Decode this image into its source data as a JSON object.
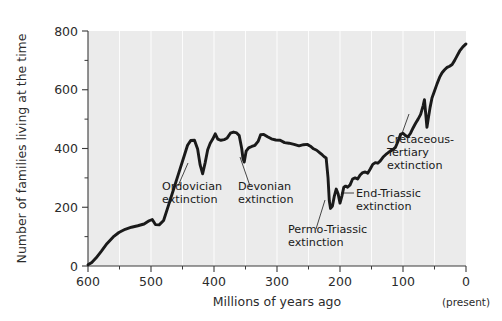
{
  "chart_data": {
    "type": "line",
    "title": "",
    "xlabel": "Millions of years ago",
    "ylabel": "Number of families living at the time",
    "xlim": [
      600,
      0
    ],
    "ylim": [
      0,
      800
    ],
    "x_ticks": [
      600,
      500,
      400,
      300,
      200,
      100,
      0
    ],
    "x_minor_ticks": [
      550,
      450,
      350,
      250,
      150,
      50
    ],
    "y_ticks": [
      0,
      200,
      400,
      600,
      800
    ],
    "y_minor_ticks": [
      100,
      300,
      500,
      700
    ],
    "x_axis_note": "(present)",
    "grid": "vertical-white",
    "legend": "none",
    "series_name": "Number of families",
    "points": [
      [
        600,
        5
      ],
      [
        592,
        8
      ],
      [
        585,
        20
      ],
      [
        578,
        40
      ],
      [
        570,
        62
      ],
      [
        560,
        88
      ],
      [
        552,
        105
      ],
      [
        545,
        118
      ],
      [
        536,
        128
      ],
      [
        528,
        132
      ],
      [
        520,
        136
      ],
      [
        512,
        140
      ],
      [
        505,
        150
      ],
      [
        500,
        155
      ],
      [
        494,
        140
      ],
      [
        488,
        138
      ],
      [
        480,
        150
      ],
      [
        472,
        200
      ],
      [
        464,
        255
      ],
      [
        456,
        310
      ],
      [
        448,
        365
      ],
      [
        442,
        408
      ],
      [
        438,
        425
      ],
      [
        434,
        428
      ],
      [
        430,
        428
      ],
      [
        426,
        400
      ],
      [
        422,
        350
      ],
      [
        418,
        318
      ],
      [
        414,
        348
      ],
      [
        410,
        392
      ],
      [
        406,
        415
      ],
      [
        402,
        430
      ],
      [
        398,
        448
      ],
      [
        394,
        432
      ],
      [
        390,
        428
      ],
      [
        386,
        428
      ],
      [
        382,
        432
      ],
      [
        378,
        442
      ],
      [
        374,
        452
      ],
      [
        370,
        455
      ],
      [
        366,
        455
      ],
      [
        362,
        448
      ],
      [
        358,
        410
      ],
      [
        356,
        372
      ],
      [
        353,
        355
      ],
      [
        350,
        388
      ],
      [
        346,
        400
      ],
      [
        342,
        405
      ],
      [
        338,
        408
      ],
      [
        332,
        420
      ],
      [
        328,
        445
      ],
      [
        322,
        448
      ],
      [
        316,
        440
      ],
      [
        310,
        432
      ],
      [
        304,
        428
      ],
      [
        298,
        428
      ],
      [
        292,
        420
      ],
      [
        286,
        418
      ],
      [
        280,
        418
      ],
      [
        272,
        412
      ],
      [
        264,
        408
      ],
      [
        258,
        412
      ],
      [
        252,
        415
      ],
      [
        248,
        410
      ],
      [
        252,
        408
      ],
      [
        248,
        402
      ],
      [
        244,
        398
      ],
      [
        240,
        396
      ],
      [
        236,
        390
      ],
      [
        232,
        386
      ],
      [
        228,
        382
      ],
      [
        226,
        378
      ],
      [
        252,
        408
      ],
      [
        248,
        402
      ]
    ],
    "polyline": [
      [
        600,
        4
      ],
      [
        593,
        10
      ],
      [
        586,
        24
      ],
      [
        578,
        46
      ],
      [
        569,
        72
      ],
      [
        559,
        96
      ],
      [
        550,
        112
      ],
      [
        541,
        124
      ],
      [
        532,
        131
      ],
      [
        522,
        136
      ],
      [
        512,
        141
      ],
      [
        504,
        152
      ],
      [
        499,
        157
      ],
      [
        494,
        141
      ],
      [
        488,
        139
      ],
      [
        481,
        151
      ],
      [
        473,
        203
      ],
      [
        465,
        258
      ],
      [
        457,
        312
      ],
      [
        449,
        366
      ],
      [
        443,
        409
      ],
      [
        438,
        426
      ],
      [
        432,
        428
      ],
      [
        427,
        400
      ],
      [
        423,
        347
      ],
      [
        419,
        316
      ],
      [
        415,
        350
      ],
      [
        411,
        394
      ],
      [
        407,
        417
      ],
      [
        403,
        431
      ],
      [
        399,
        449
      ],
      [
        395,
        433
      ],
      [
        390,
        428
      ],
      [
        385,
        429
      ],
      [
        380,
        434
      ],
      [
        375,
        450
      ],
      [
        370,
        456
      ],
      [
        365,
        454
      ],
      [
        361,
        446
      ],
      [
        357,
        404
      ],
      [
        355,
        368
      ],
      [
        353,
        354
      ],
      [
        350,
        390
      ],
      [
        346,
        401
      ],
      [
        341,
        406
      ],
      [
        336,
        410
      ],
      [
        331,
        422
      ],
      [
        327,
        446
      ],
      [
        322,
        448
      ],
      [
        316,
        440
      ],
      [
        310,
        433
      ],
      [
        303,
        429
      ],
      [
        296,
        428
      ],
      [
        289,
        420
      ],
      [
        282,
        418
      ],
      [
        274,
        414
      ],
      [
        266,
        409
      ],
      [
        259,
        413
      ],
      [
        253,
        414
      ],
      [
        248,
        409
      ],
      [
        243,
        400
      ],
      [
        238,
        395
      ],
      [
        233,
        386
      ],
      [
        229,
        380
      ],
      [
        226,
        374
      ],
      [
        252,
        412
      ],
      [
        246,
        402
      ],
      [
        251,
        410
      ]
    ],
    "curve": [
      [
        600,
        4
      ],
      [
        594,
        12
      ],
      [
        587,
        28
      ],
      [
        579,
        50
      ],
      [
        570,
        76
      ],
      [
        560,
        99
      ],
      [
        551,
        114
      ],
      [
        541,
        125
      ],
      [
        531,
        132
      ],
      [
        521,
        137
      ],
      [
        511,
        143
      ],
      [
        503,
        154
      ],
      [
        498,
        158
      ],
      [
        493,
        141
      ],
      [
        487,
        140
      ],
      [
        480,
        155
      ],
      [
        472,
        208
      ],
      [
        464,
        262
      ],
      [
        456,
        316
      ],
      [
        448,
        370
      ],
      [
        442,
        411
      ],
      [
        437,
        427
      ],
      [
        431,
        428
      ],
      [
        426,
        398
      ],
      [
        422,
        344
      ],
      [
        418,
        314
      ],
      [
        414,
        352
      ],
      [
        410,
        396
      ],
      [
        406,
        418
      ],
      [
        402,
        432
      ],
      [
        398,
        450
      ],
      [
        394,
        432
      ],
      [
        389,
        428
      ],
      [
        384,
        430
      ],
      [
        379,
        436
      ],
      [
        374,
        452
      ],
      [
        369,
        456
      ],
      [
        364,
        453
      ],
      [
        360,
        444
      ],
      [
        356,
        400
      ],
      [
        354,
        366
      ],
      [
        352,
        354
      ],
      [
        349,
        391
      ],
      [
        345,
        402
      ],
      [
        340,
        407
      ],
      [
        335,
        411
      ],
      [
        330,
        424
      ],
      [
        326,
        447
      ],
      [
        321,
        448
      ],
      [
        315,
        440
      ],
      [
        309,
        433
      ],
      [
        302,
        429
      ],
      [
        295,
        428
      ],
      [
        288,
        420
      ],
      [
        281,
        418
      ],
      [
        273,
        414
      ],
      [
        265,
        409
      ],
      [
        258,
        413
      ],
      [
        252,
        414
      ],
      [
        247,
        408
      ],
      [
        242,
        399
      ],
      [
        237,
        394
      ],
      [
        232,
        385
      ],
      [
        228,
        378
      ],
      [
        225,
        372
      ],
      [
        222,
        368
      ],
      [
        219,
        300
      ],
      [
        217,
        222
      ],
      [
        215,
        196
      ],
      [
        212,
        204
      ],
      [
        209,
        238
      ],
      [
        206,
        262
      ],
      [
        203,
        246
      ],
      [
        200,
        214
      ],
      [
        197,
        238
      ],
      [
        194,
        268
      ],
      [
        191,
        272
      ],
      [
        188,
        268
      ],
      [
        184,
        276
      ],
      [
        180,
        296
      ],
      [
        176,
        300
      ],
      [
        172,
        296
      ],
      [
        168,
        310
      ],
      [
        164,
        318
      ],
      [
        160,
        320
      ],
      [
        156,
        316
      ],
      [
        152,
        330
      ],
      [
        148,
        346
      ],
      [
        144,
        352
      ],
      [
        140,
        350
      ],
      [
        136,
        358
      ],
      [
        131,
        372
      ],
      [
        126,
        382
      ],
      [
        121,
        390
      ],
      [
        116,
        396
      ],
      [
        112,
        404
      ],
      [
        108,
        424
      ],
      [
        104,
        448
      ],
      [
        100,
        452
      ],
      [
        96,
        444
      ],
      [
        92,
        440
      ],
      [
        88,
        452
      ],
      [
        84,
        470
      ],
      [
        80,
        486
      ],
      [
        76,
        500
      ],
      [
        72,
        516
      ],
      [
        68,
        546
      ],
      [
        66,
        566
      ],
      [
        64,
        520
      ],
      [
        62,
        472
      ],
      [
        60,
        500
      ],
      [
        57,
        540
      ],
      [
        54,
        572
      ],
      [
        50,
        596
      ],
      [
        46,
        620
      ],
      [
        42,
        642
      ],
      [
        38,
        658
      ],
      [
        34,
        668
      ],
      [
        30,
        676
      ],
      [
        26,
        680
      ],
      [
        22,
        686
      ],
      [
        18,
        700
      ],
      [
        14,
        716
      ],
      [
        10,
        732
      ],
      [
        5,
        746
      ],
      [
        0,
        756
      ]
    ],
    "annotations": [
      {
        "id": "ordovician",
        "lines": [
          "Ordovician",
          "extinction"
        ],
        "text_x": 162,
        "text_y": 190,
        "leader": [
          [
            178,
            186
          ],
          [
            188,
            163
          ]
        ]
      },
      {
        "id": "devonian",
        "lines": [
          "Devonian",
          "extinction"
        ],
        "text_x": 238,
        "text_y": 190,
        "leader": [
          [
            250,
            186
          ],
          [
            240,
            157
          ]
        ]
      },
      {
        "id": "permo-triassic",
        "lines": [
          "Permo-Triassic",
          "extinction"
        ],
        "text_x": 288,
        "text_y": 233,
        "leader": [
          [
            316,
            229
          ],
          [
            325,
            200
          ]
        ]
      },
      {
        "id": "end-triassic",
        "lines": [
          "End-Triassic",
          "extinction"
        ],
        "text_x": 356,
        "text_y": 197,
        "leader": [
          [
            354,
            193
          ],
          [
            341,
            193
          ]
        ]
      },
      {
        "id": "cretaceous-tertiary",
        "lines": [
          "Cretaceous-",
          "Tertiary",
          "extinction"
        ],
        "text_x": 387,
        "text_y": 143,
        "leader": [
          [
            400,
            139
          ],
          [
            409,
            114
          ]
        ]
      }
    ]
  }
}
